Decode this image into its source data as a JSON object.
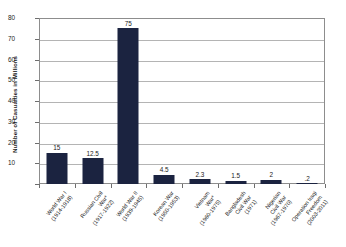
{
  "chart_data": {
    "type": "bar",
    "title": "",
    "subtitle": "",
    "xlabel": "",
    "ylabel": "Number of Casualties in Millions",
    "ylim": [
      0,
      80
    ],
    "yticks": [
      0,
      10,
      20,
      30,
      40,
      50,
      60,
      70,
      80
    ],
    "ytick_labels": [
      "",
      "10",
      "20",
      "30",
      "40",
      "50",
      "60",
      "70",
      "80"
    ],
    "grid": true,
    "grid_axis": "y",
    "legend": false,
    "legend_position": "none",
    "bar_color": "#1b2340",
    "categories": [
      "World War I\n(1914-1918)",
      "Russian Civil\nWar*\n(1917-1922)",
      "World War II\n(1939-1945)",
      "Korean War\n(1950-1953)",
      "Vietnam\nWar*\n(1960-1975)",
      "Bangladesh\nCivil War\n(1971)",
      "Nigerian\nCivil War\n(1967-1970)",
      "Operation Iraqi\nFreedom\n(2003-2011)"
    ],
    "values": [
      15,
      12.5,
      75,
      4.5,
      2.3,
      1.5,
      2,
      0.2
    ],
    "value_labels": [
      "15",
      "12.5",
      "75",
      "4.5",
      "2.3",
      "1.5",
      "2",
      ".2"
    ]
  },
  "colors": {
    "bar": "#1b2340",
    "grid": "#b4b4b4",
    "frame": "#8d8d8d",
    "text": "#1a1a1a",
    "background": "#ffffff"
  }
}
